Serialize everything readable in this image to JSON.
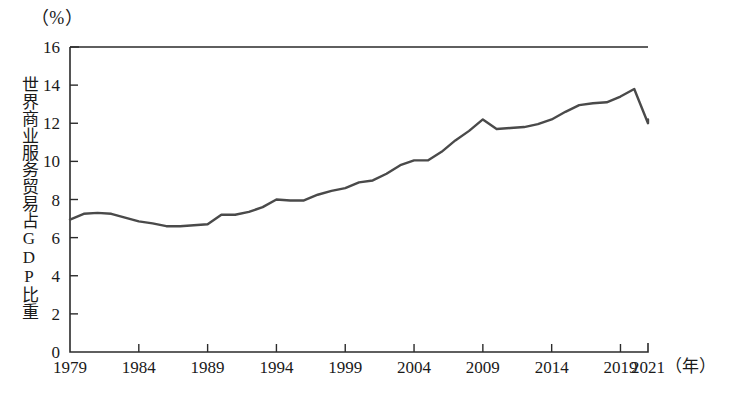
{
  "chart_data": {
    "type": "line",
    "title": "",
    "unit_label": "（%）",
    "ylabel": "世界商业服务贸易占GDP比重",
    "xlabel": "（年）",
    "xlim": [
      1979,
      2021
    ],
    "ylim": [
      0,
      16
    ],
    "ytick_step": 2,
    "ytick_labels": [
      "0",
      "2",
      "4",
      "6",
      "8",
      "10",
      "12",
      "14",
      "16"
    ],
    "ytick_values": [
      0,
      2,
      4,
      6,
      8,
      10,
      12,
      14,
      16
    ],
    "xtick_labels": [
      "1979",
      "1984",
      "1989",
      "1994",
      "1999",
      "2004",
      "2009",
      "2014",
      "2019",
      "2021"
    ],
    "xtick_values": [
      1979,
      1984,
      1989,
      1994,
      1999,
      2004,
      2009,
      2014,
      2019,
      2021
    ],
    "grid": false,
    "legend": false,
    "line_color": "#4a4a4a",
    "x": [
      1979,
      1980,
      1981,
      1982,
      1983,
      1984,
      1985,
      1986,
      1987,
      1988,
      1989,
      1990,
      1991,
      1992,
      1993,
      1994,
      1995,
      1996,
      1997,
      1998,
      1999,
      2000,
      2001,
      2002,
      2003,
      2004,
      2005,
      2006,
      2007,
      2008,
      2009,
      2010,
      2011,
      2012,
      2013,
      2014,
      2015,
      2016,
      2017,
      2018,
      2019,
      2020,
      2021
    ],
    "values": [
      6.95,
      7.25,
      7.3,
      7.25,
      7.05,
      6.85,
      6.75,
      6.6,
      6.6,
      6.65,
      6.7,
      7.2,
      7.2,
      7.35,
      7.6,
      8.0,
      7.95,
      7.95,
      8.25,
      8.45,
      8.6,
      8.9,
      9.0,
      9.35,
      9.8,
      10.05,
      10.05,
      10.5,
      11.1,
      11.6,
      12.2,
      11.7,
      11.75,
      11.8,
      11.95,
      12.2,
      12.6,
      12.95,
      13.05,
      13.1,
      13.4,
      13.8,
      12.0
    ],
    "series_name": "世界商业服务贸易占GDP比重",
    "note": "2020年值12.0为新冠疫情导致的骤降，2021年回升至12.2",
    "last_point_year": 2021,
    "last_point_value": 12.2
  },
  "caption": ""
}
